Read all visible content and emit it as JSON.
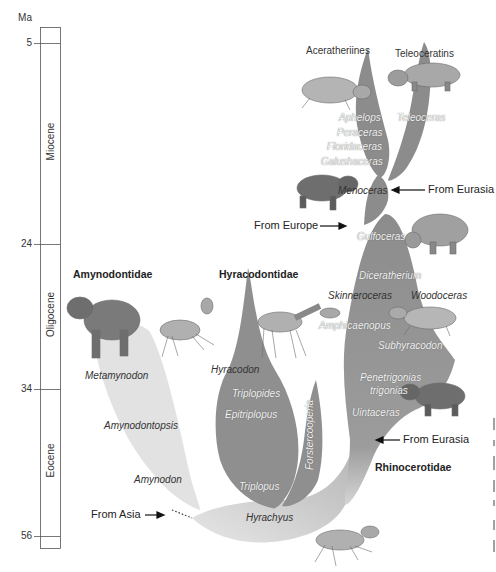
{
  "figure": {
    "units_label": "Ma",
    "time_ticks": [
      {
        "value": "5",
        "y": 43
      },
      {
        "value": "24",
        "y": 244
      },
      {
        "value": "34",
        "y": 389
      },
      {
        "value": "56",
        "y": 536
      }
    ],
    "epochs": [
      {
        "name": "Miocene",
        "y_center": 143
      },
      {
        "name": "Oligocene",
        "y_center": 316
      },
      {
        "name": "Eocene",
        "y_center": 462
      }
    ],
    "families": {
      "amynodontidae": "Amynodontidae",
      "hyracodontidae": "Hyracodontidae",
      "rhinocerotidae": "Rhinocerotidae"
    },
    "clades": {
      "aceratheriines": "Aceratheriines",
      "teleoceratins": "Teleoceratins"
    },
    "genera": {
      "aphelops": "Aphelops",
      "peraceras": "Peraceras",
      "floridaceras": "Floridaceras",
      "galushaceras": "Galushaceras",
      "teleoceras": "Teleoceras",
      "menoceras": "Menoceras",
      "gulfoceras": "Gulfoceras",
      "diceratherium": "Diceratherium",
      "skinneroceras": "Skinneroceras",
      "woodoceras": "Woodoceras",
      "amphicaenopus": "Amphicaenopus",
      "subhyracodon": "Subhyracodon",
      "penetrigonias": "Penetrigonias",
      "trigonias": "trigonias",
      "uintaceras": "Uintaceras",
      "metamynodon": "Metamynodon",
      "amynodontopsis": "Amynodontopsis",
      "amynodon": "Amynodon",
      "hyracodon": "Hyracodon",
      "triplopides": "Triplopides",
      "epitriplopus": "Epitriplopus",
      "triplopus": "Triplopus",
      "forstercooperia": "Forstercooperia",
      "hyrachyus": "Hyrachyus"
    },
    "migrations": {
      "from_eurasia_top": "From Eurasia",
      "from_europe": "From Europe",
      "from_eurasia_bottom": "From Eurasia",
      "from_asia": "From Asia"
    },
    "colors": {
      "rhino_branch": "#8c8c8c",
      "hyracodont_branch": "#8f8f8f",
      "amynodont_branch": "#e2e2e2",
      "hyrachyus_branch": "#e6e6e6",
      "animal_fill": "#9a9a9a",
      "timescale_line": "#555555"
    }
  }
}
